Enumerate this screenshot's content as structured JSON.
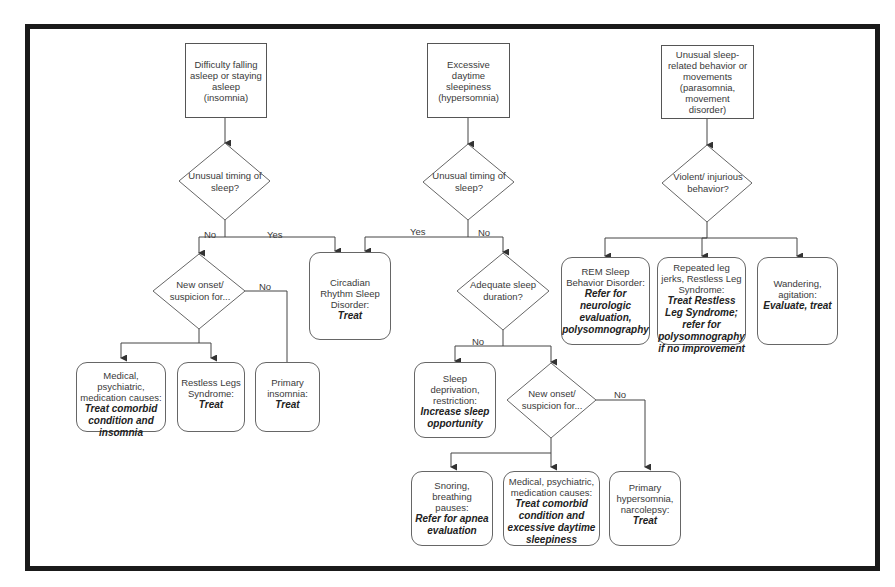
{
  "diagram": {
    "type": "flowchart",
    "title": "",
    "starts": [
      {
        "id": "insomnia",
        "text": "Difficulty falling asleep or staying asleep (insomnia)"
      },
      {
        "id": "hypersomnia",
        "text": "Excessive daytime sleepiness (hypersomnia)"
      },
      {
        "id": "parasomnia",
        "text": "Unusual sleep-related behavior or movements (parasomnia, movement disorder)"
      }
    ],
    "decisions": {
      "d1": {
        "text": "Unusual timing of sleep?"
      },
      "d2": {
        "text": "New onset/ suspicion for..."
      },
      "d3": {
        "text": "Unusual timing of sleep?"
      },
      "d4": {
        "text": "Adequate sleep duration?"
      },
      "d5": {
        "text": "New onset/ suspicion for..."
      },
      "d6": {
        "text": "Violent/ injurious behavior?"
      }
    },
    "edge_labels": {
      "d1_no": "No",
      "d1_yes": "Yes",
      "d2_no": "No",
      "d3_yes": "Yes",
      "d3_no": "No",
      "d4_no": "No",
      "d5_no": "No"
    },
    "outcomes": {
      "circadian": {
        "desc": "Circadian Rhythm Sleep Disorder:",
        "action": "Treat"
      },
      "ins_medical": {
        "desc": "Medical, psychiatric, medication causes:",
        "action": "Treat comorbid condition and insomnia"
      },
      "ins_rls": {
        "desc": "Restless Legs Syndrome:",
        "action": "Treat"
      },
      "ins_primary": {
        "desc": "Primary insomnia:",
        "action": "Treat"
      },
      "deprivation": {
        "desc": "Sleep deprivation, restriction:",
        "action": "Increase sleep opportunity"
      },
      "snoring": {
        "desc": "Snoring, breathing pauses:",
        "action": "Refer for apnea evaluation"
      },
      "hyp_medical": {
        "desc": "Medical, psychiatric, medication causes:",
        "action": "Treat comorbid condition and excessive daytime sleepiness"
      },
      "hyp_primary": {
        "desc": "Primary hypersomnia, narcolepsy:",
        "action": "Treat"
      },
      "rem": {
        "desc": "REM Sleep Behavior Disorder:",
        "action": "Refer for neurologic evaluation, polysomnography"
      },
      "legjerks": {
        "desc": "Repeated leg jerks, Restless Leg Syndrome:",
        "action": "Treat Restless Leg Syndrome; refer for polysomnography if no improvement"
      },
      "wandering": {
        "desc": "Wandering, agitation:",
        "action": "Evaluate, treat"
      }
    },
    "edges": [
      [
        "insomnia",
        "d1"
      ],
      [
        "d1",
        "d2",
        "No"
      ],
      [
        "d1",
        "circadian",
        "Yes"
      ],
      [
        "d2",
        "ins_medical"
      ],
      [
        "d2",
        "ins_rls"
      ],
      [
        "d2",
        "ins_primary",
        "No"
      ],
      [
        "hypersomnia",
        "d3"
      ],
      [
        "d3",
        "circadian",
        "Yes"
      ],
      [
        "d3",
        "d4",
        "No"
      ],
      [
        "d4",
        "deprivation",
        "No"
      ],
      [
        "d4",
        "d5",
        "No"
      ],
      [
        "d5",
        "snoring"
      ],
      [
        "d5",
        "hyp_medical"
      ],
      [
        "d5",
        "hyp_primary",
        "No"
      ],
      [
        "parasomnia",
        "d6"
      ],
      [
        "d6",
        "rem"
      ],
      [
        "d6",
        "legjerks"
      ],
      [
        "d6",
        "wandering"
      ]
    ]
  }
}
